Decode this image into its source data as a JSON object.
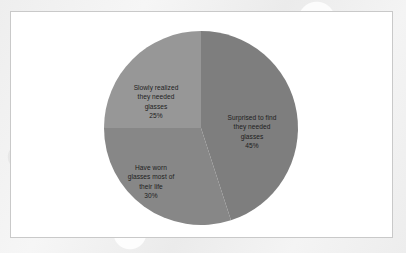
{
  "chart_data": {
    "type": "pie",
    "title": "",
    "categories": [
      "Surprised to find they needed glasses",
      "Have worn glasses most of their life",
      "Slowly realized they needed glasses"
    ],
    "values": [
      45,
      30,
      25
    ],
    "value_unit": "%",
    "start_angle_deg": 0,
    "direction": "clockwise",
    "legend": "none",
    "grid": false,
    "labels_inside": true,
    "slices": [
      {
        "name": "surprised-to-find",
        "label_lines": [
          "Surprised to find",
          "they needed",
          "glasses"
        ],
        "label_text": "Surprised to find\nthey needed\nglasses",
        "percent_text": "45%",
        "value": 45,
        "color": "#7e7e7e",
        "start_deg": 0,
        "end_deg": 162
      },
      {
        "name": "have-worn-glasses",
        "label_lines": [
          "Have worn",
          "glasses most of",
          "their life"
        ],
        "label_text": "Have worn\nglasses most of\ntheir life",
        "percent_text": "30%",
        "value": 30,
        "color": "#878787",
        "start_deg": 162,
        "end_deg": 270
      },
      {
        "name": "slowly-realized",
        "label_lines": [
          "Slowly realized",
          "they needed",
          "glasses"
        ],
        "label_text": "Slowly realized\nthey needed\nglasses",
        "percent_text": "25%",
        "value": 25,
        "color": "#979797",
        "start_deg": 270,
        "end_deg": 360
      }
    ]
  },
  "style": {
    "label_text_color": "#1d1d1d",
    "frame_border_color": "#c9c9c9",
    "frame_background": "#ffffff",
    "page_background": "#f1f1f1"
  }
}
